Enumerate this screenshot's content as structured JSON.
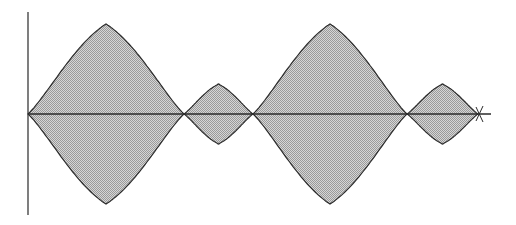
{
  "figure": {
    "colors": {
      "background": "#ffffff",
      "fill": "#c4c4c4",
      "stroke": "#2a2a2a",
      "axis": "#3a3a3a"
    },
    "axes": {
      "vertical": {
        "x": 28,
        "y_top": 12,
        "y_bottom": 215
      },
      "horizontal": {
        "y": 114,
        "x_start": 28,
        "x_end": 491
      }
    },
    "lobes": [
      {
        "name": "large-lobe-1",
        "x_start": 28,
        "x_end": 184,
        "amplitude": 90
      },
      {
        "name": "small-lobe-1",
        "x_start": 184,
        "x_end": 253,
        "amplitude": 30
      },
      {
        "name": "large-lobe-2",
        "x_start": 253,
        "x_end": 407,
        "amplitude": 90
      },
      {
        "name": "small-lobe-2",
        "x_start": 407,
        "x_end": 478,
        "amplitude": 30
      }
    ]
  }
}
